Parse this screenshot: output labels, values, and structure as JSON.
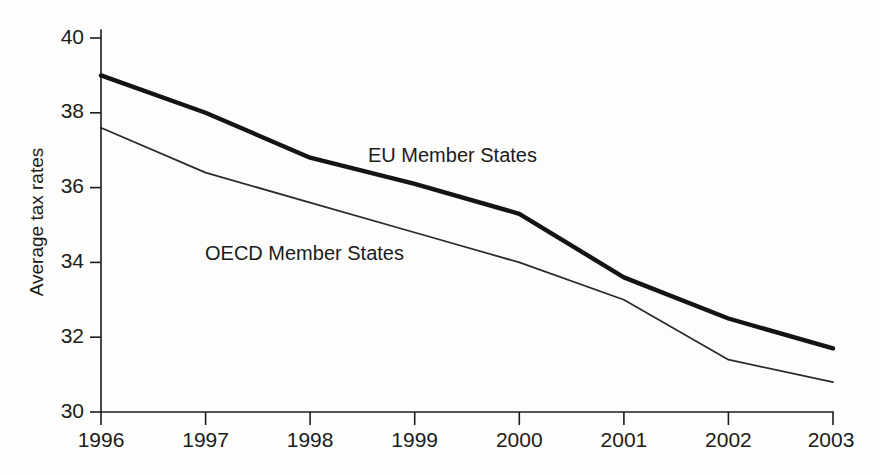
{
  "chart_data": {
    "type": "line",
    "title": "",
    "subtitle": "",
    "xlabel": "",
    "ylabel": "Average tax rates",
    "categories": [
      "1996",
      "1997",
      "1998",
      "1999",
      "2000",
      "2001",
      "2002",
      "2003"
    ],
    "x": [
      1996,
      1997,
      1998,
      1999,
      2000,
      2001,
      2002,
      2003
    ],
    "xlim": [
      1996,
      2003
    ],
    "ylim": [
      30,
      40
    ],
    "y_ticks": [
      "40",
      "38",
      "36",
      "34",
      "32",
      "30"
    ],
    "y_tick_values": [
      40,
      38,
      36,
      34,
      32,
      30
    ],
    "grid": false,
    "legend_position": "inline-annotation",
    "series": [
      {
        "name": "EU Member States",
        "label": "EU Member States",
        "values": [
          39.0,
          38.0,
          36.8,
          36.1,
          35.3,
          33.6,
          32.5,
          31.7
        ],
        "style": "thick",
        "color": "#141414"
      },
      {
        "name": "OECD Member States",
        "label": "OECD Member States",
        "values": [
          37.6,
          36.4,
          35.6,
          34.8,
          34.0,
          33.0,
          31.4,
          30.8
        ],
        "style": "thin",
        "color": "#2a2a2a"
      }
    ],
    "annotations": [
      {
        "text": "EU Member States",
        "x_px": 368,
        "y_px": 162
      },
      {
        "text": "OECD Member States",
        "x_px": 205,
        "y_px": 260
      }
    ]
  }
}
